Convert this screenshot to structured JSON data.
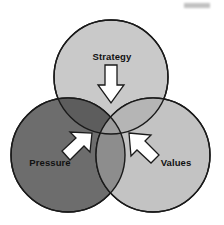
{
  "diagram": {
    "type": "venn-3-circle",
    "title_visible": false,
    "canvas": {
      "width": 224,
      "height": 225,
      "background": "#ffffff"
    },
    "circles": [
      {
        "id": "strategy",
        "label": "Strategy",
        "position": "top",
        "fill": "#c9c9c9",
        "stroke": "#1a1a1a",
        "cx": 111,
        "cy": 77,
        "r": 57
      },
      {
        "id": "pressure",
        "label": "Pressure",
        "position": "bottom-left",
        "fill": "#6d6d6d",
        "stroke": "#1a1a1a",
        "cx": 68,
        "cy": 155,
        "r": 57
      },
      {
        "id": "values",
        "label": "Values",
        "position": "bottom-right",
        "fill": "#c3c3c3",
        "stroke": "#1a1a1a",
        "cx": 153,
        "cy": 155,
        "r": 57
      }
    ],
    "overlaps": [
      {
        "id": "strategy-pressure",
        "fill": "#5d5d5d"
      },
      {
        "id": "strategy-values",
        "fill": "#b5b5b5"
      },
      {
        "id": "pressure-values",
        "fill": "#8d8d8d"
      },
      {
        "id": "center-all-three",
        "fill": "#9e9e9e"
      }
    ],
    "arrows": [
      {
        "id": "strategy-arrow",
        "label": "Strategy",
        "direction": "down",
        "fill": "#ffffff",
        "stroke": "#1a1a1a",
        "points_to": "center"
      },
      {
        "id": "pressure-arrow",
        "label": "Pressure",
        "direction": "up-right",
        "fill": "#ffffff",
        "stroke": "#1a1a1a",
        "points_to": "center"
      },
      {
        "id": "values-arrow",
        "label": "Values",
        "direction": "up-left",
        "fill": "#ffffff",
        "stroke": "#1a1a1a",
        "points_to": "center"
      }
    ],
    "labels": {
      "strategy": {
        "text": "Strategy",
        "x": 112,
        "y": 60,
        "anchor": "middle"
      },
      "pressure": {
        "text": "Pressure",
        "x": 50,
        "y": 166,
        "anchor": "middle"
      },
      "values": {
        "text": "Values",
        "x": 176,
        "y": 166,
        "anchor": "middle"
      }
    }
  }
}
